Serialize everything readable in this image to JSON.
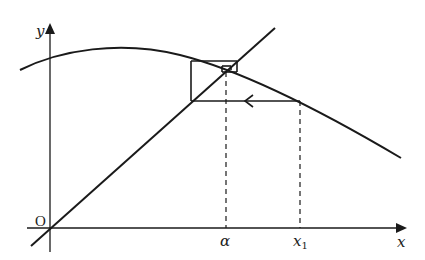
{
  "diagram": {
    "type": "cobweb-iteration",
    "axes": {
      "x_label": "x",
      "y_label": "y",
      "origin_label": "O"
    },
    "points": {
      "alpha_label": "α",
      "x1_label": "x",
      "x1_subscript": "1"
    },
    "colors": {
      "stroke": "#1a1a1a",
      "background": "#ffffff"
    }
  }
}
